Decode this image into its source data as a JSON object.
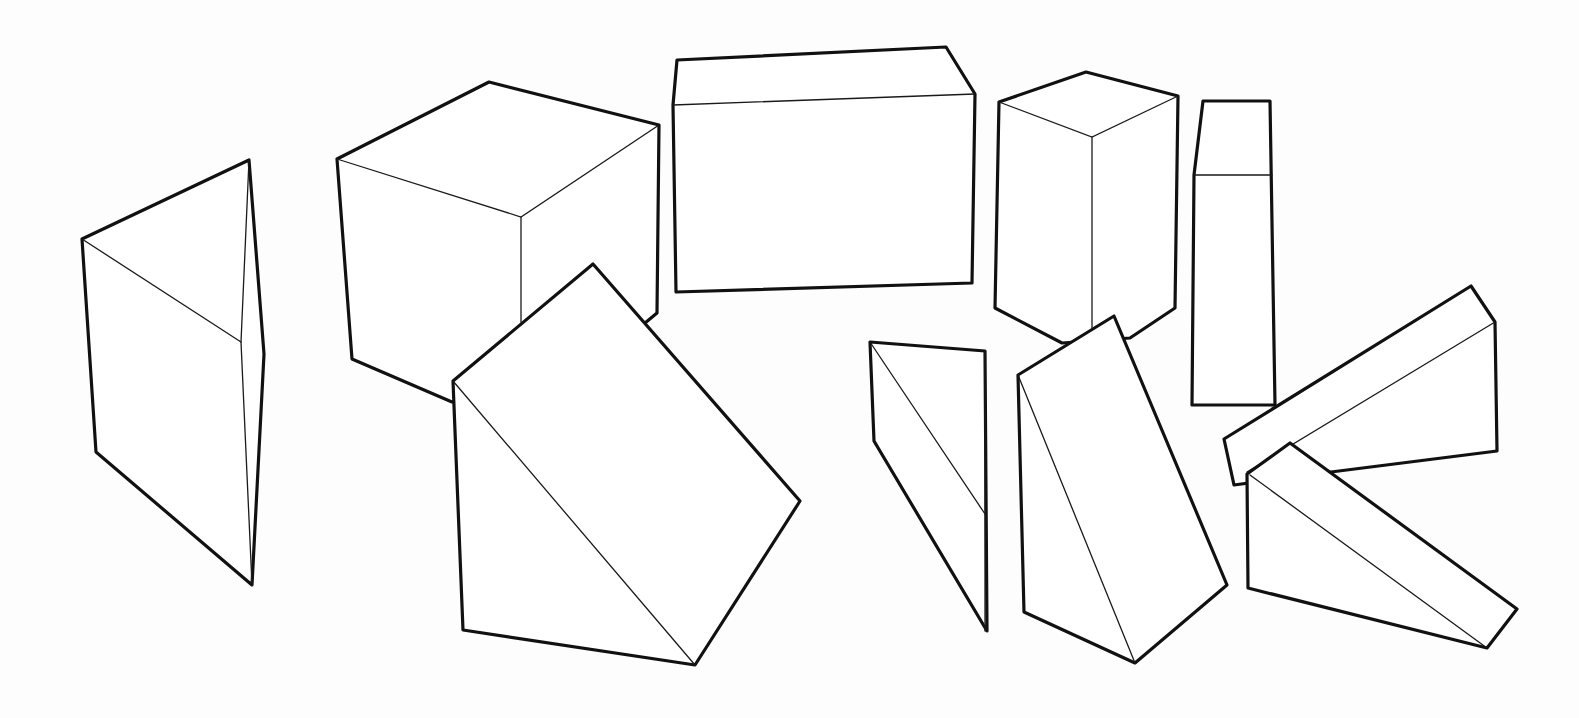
{
  "figure": {
    "background": "#ffffff",
    "stroke_color": "#111111",
    "shapes": [
      {
        "id": "prism-left",
        "kind": "triangular-prism",
        "outline": "82,239 249,160 264,354 252,585 96,452",
        "edges": [
          "82,239 241,342",
          "249,160 241,342 252,585"
        ]
      },
      {
        "id": "cube",
        "kind": "cube",
        "outline": "337,159 489,82 659,125 657,313 645,323 452,402 352,359",
        "edges": [
          "337,159 521,217 659,125",
          "521,217 521,322"
        ]
      },
      {
        "id": "wedge-large",
        "kind": "wedge",
        "outline": "453,381 593,264 800,501 695,665 463,630",
        "edges": [
          "453,381 695,665"
        ]
      },
      {
        "id": "box-wide",
        "kind": "rectangular-box",
        "outline": "677,60 946,47 975,94 972,283 676,292 673,105",
        "edges": [
          "673,105 975,94"
        ]
      },
      {
        "id": "box-tall",
        "kind": "rectangular-box",
        "outline": "999,102 1086,72 1178,96 1175,308 1130,338 1062,343 995,308",
        "edges": [
          "999,102 1092,137 1178,96",
          "1092,137 1092,328"
        ]
      },
      {
        "id": "box-narrow",
        "kind": "rectangular-box",
        "outline": "1203,101 1270,101 1275,405 1192,405 1194,175",
        "edges": [
          "1194,175 1272,175"
        ]
      },
      {
        "id": "wedge-small",
        "kind": "wedge",
        "outline": "870,342 985,351 987,631 874,441",
        "edges": [
          "870,342 985,514",
          "985,351 985,631"
        ]
      },
      {
        "id": "wedge-middle",
        "kind": "wedge",
        "outline": "1018,375 1114,316 1227,585 1135,663 1024,612",
        "edges": [
          "1018,375 1135,663"
        ]
      },
      {
        "id": "wedge-upper-right",
        "kind": "wedge",
        "outline": "1224,439 1471,286 1495,322 1497,451 1331,472 1234,485",
        "edges": [
          "1247,472 1495,322"
        ]
      },
      {
        "id": "wedge-lower-right",
        "kind": "wedge",
        "outline": "1247,474 1290,443 1517,609 1487,648 1248,588",
        "edges": [
          "1250,475 1487,648"
        ]
      }
    ]
  }
}
